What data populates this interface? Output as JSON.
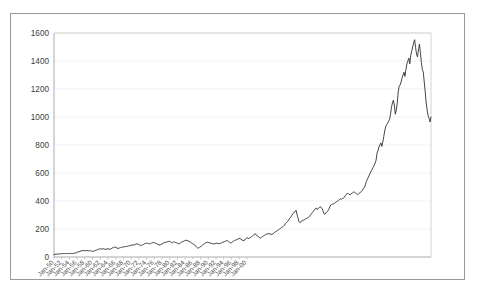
{
  "chart_data": {
    "type": "line",
    "title": "",
    "subtitle": "",
    "xlabel": "",
    "ylabel": "",
    "ylim": [
      0,
      1600
    ],
    "ytick_step": 200,
    "ytick_labels": [
      "0",
      "200",
      "400",
      "600",
      "800",
      "1000",
      "1200",
      "1400",
      "1600"
    ],
    "ytick_values": [
      0,
      200,
      400,
      600,
      800,
      1000,
      1200,
      1400,
      1600
    ],
    "xtick_labels": [
      "Jan-50",
      "Jan-52",
      "Jan-54",
      "Jan-56",
      "Jan-58",
      "Jan-60",
      "Jan-62",
      "Jan-64",
      "Jan-66",
      "Jan-68",
      "Jan-70",
      "Jan-72",
      "Jan-74",
      "Jan-76",
      "Jan-78",
      "Jan-80",
      "Jan-82",
      "Jan-84",
      "Jan-86",
      "Jan-88",
      "Jan-90",
      "Jan-92",
      "Jan-94",
      "Jan-96",
      "Jan-98",
      "Jan-00"
    ],
    "xtick_label_rotation": -45,
    "grid": "horizontal",
    "legend": "none",
    "line_color": "#242424",
    "grid_color": "#ededf2",
    "axis_color": "#b4b4b4",
    "x_start": "Jan-50",
    "x_end": "Jan-01",
    "x_step_months": 3,
    "series": [
      {
        "name": "Index Level",
        "values": [
          17.0,
          18.8,
          19.4,
          20.4,
          21.7,
          21.5,
          22.4,
          23.4,
          23.8,
          24.2,
          24.4,
          24.0,
          25.1,
          24.6,
          24.0,
          24.8,
          25.5,
          26.0,
          24.5,
          24.8,
          26.2,
          27.0,
          28.2,
          29.3,
          35.6,
          36.5,
          37.5,
          40.3,
          43.8,
          45.0,
          45.5,
          45.2,
          45.4,
          44.0,
          46.5,
          45.5,
          44.2,
          45.1,
          45.8,
          41.0,
          40.3,
          42.2,
          44.1,
          46.8,
          49.0,
          52.5,
          55.5,
          57.0,
          59.3,
          57.1,
          56.5,
          59.9,
          56.5,
          55.1,
          55.2,
          58.0,
          58.6,
          57.5,
          55.3,
          57.0,
          62.1,
          66.2,
          67.6,
          71.5,
          69.5,
          68.8,
          58.0,
          62.6,
          65.0,
          67.0,
          68.9,
          70.2,
          71.3,
          73.4,
          74.5,
          75.0,
          76.6,
          79.0,
          80.0,
          81.4,
          83.0,
          86.2,
          87.0,
          84.8,
          88.8,
          92.4,
          94.0,
          92.4,
          89.0,
          86.0,
          79.8,
          85.2,
          86.8,
          90.2,
          95.0,
          96.5,
          98.7,
          97.7,
          97.2,
          95.0,
          93.0,
          99.0,
          101.3,
          103.9,
          103.0,
          100.0,
          97.7,
          92.2,
          90.3,
          88.0,
          83.2,
          92.1,
          93.5,
          97.5,
          102.0,
          103.8,
          104.9,
          107.8,
          109.5,
          112.0,
          111.7,
          107.2,
          104.0,
          102.1,
          108.8,
          106.0,
          104.5,
          102.0,
          99.0,
          95.0,
          93.5,
          100.9,
          103.9,
          108.9,
          111.0,
          114.2,
          118.0,
          120.2,
          117.0,
          116.0,
          112.0,
          109.0,
          104.0,
          97.6,
          95.0,
          90.0,
          86.0,
          77.0,
          70.0,
          65.0,
          63.5,
          68.6,
          72.3,
          80.1,
          85.0,
          90.2,
          95.0,
          100.0,
          103.0,
          105.5,
          103.3,
          102.0,
          100.0,
          98.5,
          96.2,
          94.2,
          93.2,
          95.1,
          98.4,
          99.1,
          96.0,
          95.5,
          96.5,
          98.0,
          102.0,
          105.0,
          107.5,
          110.0,
          113.7,
          117.0,
          116.0,
          112.0,
          105.0,
          101.0,
          102.0,
          108.0,
          112.0,
          117.0,
          120.4,
          122.0,
          125.5,
          129.0,
          133.0,
          131.0,
          128.0,
          122.0,
          116.0,
          118.0,
          122.0,
          130.0,
          138.0,
          135.0,
          132.0,
          135.8,
          140.0,
          145.0,
          152.0,
          158.0,
          163.0,
          165.0,
          155.0,
          150.0,
          145.0,
          140.0,
          135.0,
          139.5,
          145.0,
          150.0,
          153.0,
          159.0,
          162.0,
          164.0,
          166.0,
          167.0,
          165.0,
          163.0,
          160.5,
          164.9,
          170.0,
          178.0,
          182.0,
          186.0,
          190.0,
          196.0,
          200.0,
          205.0,
          211.0,
          214.0,
          220.0,
          226.9,
          238.0,
          245.0,
          252.0,
          260.0,
          272.0,
          280.0,
          290.0,
          300.0,
          310.0,
          320.0,
          324.0,
          334.1,
          305.0,
          280.0,
          255.0,
          245.0,
          250.0,
          258.0,
          265.0,
          262.0,
          268.0,
          272.0,
          276.0,
          277.7,
          285.0,
          292.0,
          300.0,
          309.0,
          318.0,
          327.0,
          335.0,
          345.0,
          350.0,
          340.0,
          345.0,
          353.4,
          358.0,
          355.0,
          345.0,
          330.0,
          310.0,
          305.0,
          315.0,
          322.0,
          330.0,
          340.0,
          358.0,
          371.2,
          375.0,
          378.0,
          380.0,
          385.0,
          390.0,
          395.0,
          398.0,
          405.0,
          410.0,
          415.0,
          412.0,
          417.1,
          420.0,
          425.0,
          437.0,
          447.0,
          452.0,
          455.0,
          448.0,
          444.0,
          450.0,
          455.0,
          460.0,
          466.5,
          460.0,
          455.0,
          450.0,
          447.0,
          452.0,
          458.0,
          462.0,
          470.0,
          478.0,
          490.0,
          500.0,
          515.0,
          540.0,
          555.0,
          570.0,
          585.0,
          600.0,
          615.0,
          625.0,
          640.0,
          655.0,
          670.0,
          690.0,
          740.7,
          760.0,
          785.0,
          800.0,
          815.0,
          790.0,
          820.0,
          860.0,
          900.0,
          930.0,
          945.0,
          955.0,
          970.4,
          980.0,
          1020.0,
          1070.0,
          1100.0,
          1120.0,
          1085.0,
          1020.0,
          1050.0,
          1100.0,
          1180.0,
          1220.0,
          1229.2,
          1250.0,
          1280.0,
          1300.0,
          1320.0,
          1290.0,
          1340.0,
          1380.0,
          1400.0,
          1420.0,
          1380.0,
          1440.0,
          1469.3,
          1500.0,
          1530.0,
          1552.0,
          1498.0,
          1450.0,
          1430.0,
          1480.0,
          1520.0,
          1460.0,
          1390.0,
          1340.0,
          1320.3,
          1250.0,
          1180.0,
          1100.0,
          1050.0,
          1010.0,
          990.0,
          965.0,
          1000.0
        ]
      }
    ]
  }
}
